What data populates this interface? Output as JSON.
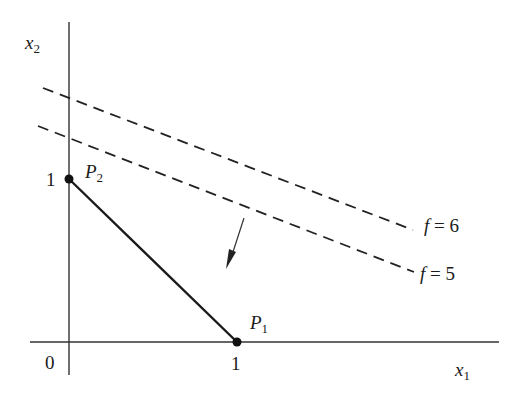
{
  "diagram": {
    "type": "linear-programming-feasible-region",
    "axes": {
      "x_label": "x",
      "x_label_sub": "1",
      "y_label": "x",
      "y_label_sub": "2",
      "origin_label": "0",
      "x_tick_label": "1",
      "y_tick_label": "1"
    },
    "points": [
      {
        "name": "P",
        "sub": "1",
        "coords": [
          1,
          0
        ]
      },
      {
        "name": "P",
        "sub": "2",
        "coords": [
          0,
          1
        ]
      }
    ],
    "segment": {
      "from": "P2",
      "to": "P1",
      "style": "solid"
    },
    "level_lines": [
      {
        "label_f": "f",
        "label_eq": " = 6",
        "style": "dashed"
      },
      {
        "label_f": "f",
        "label_eq": " = 5",
        "style": "dashed"
      }
    ],
    "arrow": {
      "meaning": "direction of decreasing f"
    },
    "colors": {
      "ink": "#1a1a1a",
      "background": "#ffffff"
    }
  }
}
